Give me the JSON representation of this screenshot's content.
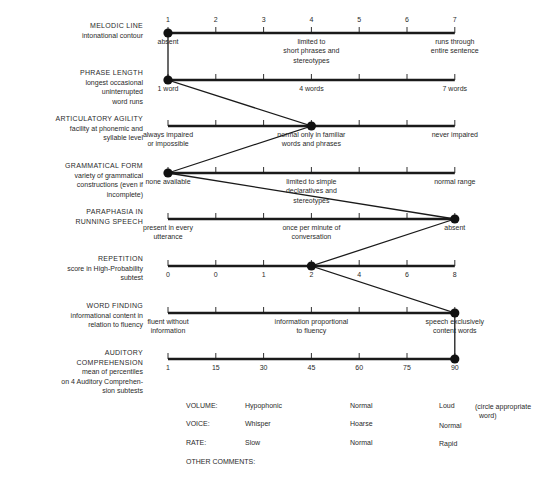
{
  "chart_data": {
    "type": "line",
    "orientation": "profile (vertical connected points across horizontal 7-point scales)",
    "scale_points": [
      1,
      2,
      3,
      4,
      5,
      6,
      7
    ],
    "grid": false,
    "rows": [
      {
        "title": "MELODIC LINE",
        "subtitle": "intonational contour",
        "tick_labels": [
          "1",
          "2",
          "3",
          "4",
          "5",
          "6",
          "7"
        ],
        "anchors": [
          {
            "position": 1,
            "text": "absent"
          },
          {
            "position": 4,
            "text": "limited to short phrases and stereotypes"
          },
          {
            "position": 7,
            "text": "runs through entire sentence"
          }
        ],
        "rating": 1
      },
      {
        "title": "PHRASE LENGTH",
        "subtitle": "longest occasional uninterrupted word runs",
        "tick_labels": [],
        "anchors": [
          {
            "position": 1,
            "text": "1 word"
          },
          {
            "position": 4,
            "text": "4 words"
          },
          {
            "position": 7,
            "text": "7 words"
          }
        ],
        "rating": 1
      },
      {
        "title": "ARTICULATORY AGILITY",
        "subtitle": "facility at phonemic and syllable level",
        "tick_labels": [],
        "anchors": [
          {
            "position": 1,
            "text": "always impaired or impossible"
          },
          {
            "position": 4,
            "text": "normal only in familiar words and phrases"
          },
          {
            "position": 7,
            "text": "never impaired"
          }
        ],
        "rating": 4
      },
      {
        "title": "GRAMMATICAL FORM",
        "subtitle": "variety of grammatical constructions (even if incomplete)",
        "tick_labels": [],
        "anchors": [
          {
            "position": 1,
            "text": "none available"
          },
          {
            "position": 4,
            "text": "limited to simple declaratives and stereotypes"
          },
          {
            "position": 7,
            "text": "normal range"
          }
        ],
        "rating": 1
      },
      {
        "title": "PARAPHASIA IN RUNNING SPEECH",
        "subtitle": "",
        "tick_labels": [],
        "anchors": [
          {
            "position": 1,
            "text": "present in every utterance"
          },
          {
            "position": 4,
            "text": "once per minute of conversation"
          },
          {
            "position": 7,
            "text": "absent"
          }
        ],
        "rating": 7
      },
      {
        "title": "REPETITION",
        "subtitle": "score in High-Probability subtest",
        "tick_labels": [
          "0",
          "0",
          "1",
          "2",
          "4",
          "6",
          "8"
        ],
        "anchors": [],
        "rating": 4,
        "rating_label": "2"
      },
      {
        "title": "WORD FINDING",
        "subtitle": "informational content in relation to fluency",
        "tick_labels": [],
        "anchors": [
          {
            "position": 1,
            "text": "fluent without information"
          },
          {
            "position": 4,
            "text": "information proportional to fluency"
          },
          {
            "position": 7,
            "text": "speech exclusively content words"
          }
        ],
        "rating": 7
      },
      {
        "title": "AUDITORY COMPREHENSION",
        "subtitle": "mean of percentiles on 4 Auditory Comprehension subtests",
        "tick_labels": [
          "1",
          "15",
          "30",
          "45",
          "60",
          "75",
          "90"
        ],
        "anchors": [],
        "rating": 7,
        "rating_label": "90"
      }
    ],
    "profile_values": [
      1,
      1,
      4,
      1,
      7,
      4,
      7,
      7
    ]
  },
  "labels": [
    {
      "title": "MELODIC LINE",
      "sub": [
        "intonational contour"
      ]
    },
    {
      "title": "PHRASE LENGTH",
      "sub": [
        "longest occasional",
        "uninterrupted",
        "word runs"
      ]
    },
    {
      "title": "ARTICULATORY AGILITY",
      "sub": [
        "facility at phonemic and",
        "syllable level"
      ]
    },
    {
      "title": "GRAMMATICAL FORM",
      "sub": [
        "variety of grammatical",
        "constructions (even if",
        "incomplete)"
      ]
    },
    {
      "title": "PARAPHASIA IN",
      "sub": [
        "RUNNING SPEECH"
      ]
    },
    {
      "title": "REPETITION",
      "sub": [
        "score in High-Probability",
        "subtest"
      ]
    },
    {
      "title": "WORD FINDING",
      "sub": [
        "informational content in",
        "relation to fluency"
      ]
    },
    {
      "title": "AUDITORY",
      "sub": [
        "COMPREHENSION",
        "mean of percentiles",
        "on 4 Auditory Comprehen-",
        "sion subtests"
      ]
    }
  ],
  "anno": {
    "r0_t": [
      "1",
      "2",
      "3",
      "4",
      "5",
      "6",
      "7"
    ],
    "r0_a1": "absent",
    "r0_a4": [
      "limited to",
      "short phrases and",
      "stereotypes"
    ],
    "r0_a7": [
      "runs through",
      "entire sentence"
    ],
    "r1_a1": "1 word",
    "r1_a4": "4 words",
    "r1_a7": "7 words",
    "r2_a1": [
      "always impaired",
      "or impossible"
    ],
    "r2_a4": [
      "normal only in familiar",
      "words and phrases"
    ],
    "r2_a7": "never impaired",
    "r3_a1": "none available",
    "r3_a4": [
      "limited to simple",
      "declaratives and",
      "stereotypes"
    ],
    "r3_a7": "normal range",
    "r4_a1": [
      "present in every",
      "utterance"
    ],
    "r4_a4": [
      "once per minute of",
      "conversation"
    ],
    "r4_a7": "absent",
    "r5_t": [
      "0",
      "0",
      "1",
      "2",
      "4",
      "6",
      "8"
    ],
    "r6_a1": [
      "fluent without",
      "information"
    ],
    "r6_a4": [
      "information proportional",
      "to fluency"
    ],
    "r6_a7": [
      "speech exclusively",
      "content words"
    ],
    "r7_t": [
      "1",
      "15",
      "30",
      "45",
      "60",
      "75",
      "90"
    ]
  },
  "bottom": {
    "volume": {
      "label": "VOLUME:",
      "options": [
        "Hypophonic",
        "Normal",
        "Loud"
      ]
    },
    "voice": {
      "label": "VOICE:",
      "options": [
        "Whisper",
        "Hoarse",
        "Normal"
      ]
    },
    "rate": {
      "label": "RATE:",
      "options": [
        "Slow",
        "Normal",
        "Rapid"
      ]
    },
    "note": [
      "(circle appropriate",
      "word)"
    ],
    "other_comments": "OTHER COMMENTS:"
  }
}
